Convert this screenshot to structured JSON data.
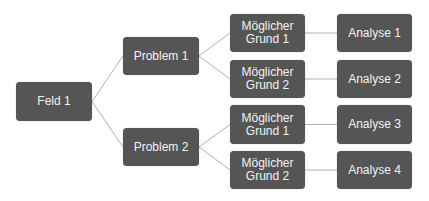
{
  "diagram": {
    "type": "tree",
    "colors": {
      "node_fill": "#555555",
      "node_text": "#f2f2f2",
      "edge": "#b0b0b0",
      "background": "#ffffff"
    },
    "nodes": [
      {
        "id": "feld1",
        "label": "Feld 1",
        "x": 16,
        "y": 82,
        "w": 76,
        "h": 39
      },
      {
        "id": "problem1",
        "label": "Problem 1",
        "x": 123,
        "y": 37,
        "w": 76,
        "h": 38
      },
      {
        "id": "problem2",
        "label": "Problem 2",
        "x": 123,
        "y": 128,
        "w": 76,
        "h": 38
      },
      {
        "id": "grund1a",
        "label": "Möglicher\nGrund 1",
        "x": 230,
        "y": 14,
        "w": 75,
        "h": 38
      },
      {
        "id": "grund2a",
        "label": "Möglicher\nGrund 2",
        "x": 230,
        "y": 60,
        "w": 75,
        "h": 38
      },
      {
        "id": "grund1b",
        "label": "Möglicher\nGrund 1",
        "x": 230,
        "y": 105,
        "w": 75,
        "h": 39
      },
      {
        "id": "grund2b",
        "label": "Möglicher\nGrund 2",
        "x": 230,
        "y": 151,
        "w": 75,
        "h": 38
      },
      {
        "id": "analyse1",
        "label": "Analyse 1",
        "x": 337,
        "y": 14,
        "w": 75,
        "h": 38
      },
      {
        "id": "analyse2",
        "label": "Analyse 2",
        "x": 337,
        "y": 60,
        "w": 75,
        "h": 38
      },
      {
        "id": "analyse3",
        "label": "Analyse 3",
        "x": 337,
        "y": 105,
        "w": 75,
        "h": 39
      },
      {
        "id": "analyse4",
        "label": "Analyse 4",
        "x": 337,
        "y": 151,
        "w": 75,
        "h": 38
      }
    ],
    "edges": [
      [
        "feld1",
        "problem1"
      ],
      [
        "feld1",
        "problem2"
      ],
      [
        "problem1",
        "grund1a"
      ],
      [
        "problem1",
        "grund2a"
      ],
      [
        "problem2",
        "grund1b"
      ],
      [
        "problem2",
        "grund2b"
      ],
      [
        "grund1a",
        "analyse1"
      ],
      [
        "grund2a",
        "analyse2"
      ],
      [
        "grund1b",
        "analyse3"
      ],
      [
        "grund2b",
        "analyse4"
      ]
    ]
  }
}
